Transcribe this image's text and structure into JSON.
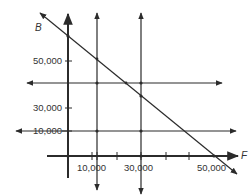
{
  "diagram": {
    "type": "linear-constraints-graph",
    "colors": {
      "line": "#2b2b2b",
      "text": "#333333",
      "background": "#ffffff"
    },
    "axes": {
      "y_label": "B",
      "x_label": "F"
    },
    "y_ticks": [
      {
        "label": "50,000",
        "value": 50000
      },
      {
        "label": "30,000",
        "value": 30000
      },
      {
        "label": "10,000",
        "value": 10000
      }
    ],
    "x_ticks": [
      {
        "label": "10,000",
        "value": 10000
      },
      {
        "label": "30,000",
        "value": 30000
      },
      {
        "label": "50,000",
        "value": 50000
      }
    ],
    "lines": [
      {
        "name": "vertical-F-10000",
        "equation": "F = 10,000"
      },
      {
        "name": "vertical-F-30000",
        "equation": "F = 30,000"
      },
      {
        "name": "horizontal-B-40000",
        "equation": "B = 40,000"
      },
      {
        "name": "horizontal-B-10000",
        "equation": "B = 10,000"
      },
      {
        "name": "diagonal",
        "equation": "F + B = 60,000"
      }
    ]
  }
}
